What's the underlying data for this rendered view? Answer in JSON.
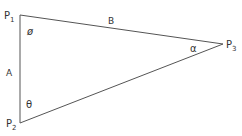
{
  "diagram": {
    "points": {
      "p1": {
        "label": "P",
        "sub": "1"
      },
      "p2": {
        "label": "P",
        "sub": "2"
      },
      "p3": {
        "label": "P",
        "sub": "3"
      }
    },
    "sides": {
      "a": "A",
      "b": "B"
    },
    "angles": {
      "phi": "ø",
      "theta": "θ",
      "alpha": "α"
    },
    "colors": {
      "line": "#555555",
      "text": "#333333"
    }
  }
}
